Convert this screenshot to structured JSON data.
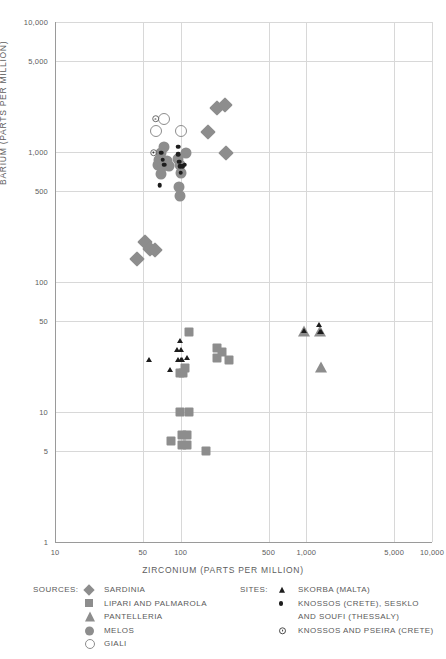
{
  "chart_data": {
    "type": "scatter",
    "title": "",
    "xlabel": "ZIRCONIUM (PARTS PER MILLION)",
    "ylabel": "BARIUM (PARTS PER MILLION)",
    "xscale": "log",
    "yscale": "log",
    "xlim": [
      10,
      10000
    ],
    "ylim": [
      1,
      10000
    ],
    "grid": true,
    "xticks": [
      10,
      50,
      100,
      500,
      1000,
      5000,
      10000
    ],
    "xtick_labels": [
      "10",
      "50",
      "100",
      "500",
      "1,000",
      "5,000",
      "10,000"
    ],
    "yticks": [
      1,
      5,
      10,
      50,
      100,
      500,
      1000,
      5000,
      10000
    ],
    "ytick_labels": [
      "1",
      "5",
      "10",
      "50",
      "100",
      "500",
      "1,000",
      "5,000",
      "10,000"
    ],
    "legend_position": "below",
    "series": [
      {
        "name": "SARDINIA",
        "marker": "diamond",
        "color": "#8d8d8d",
        "group": "sources",
        "points": [
          [
            45,
            150
          ],
          [
            52,
            205
          ],
          [
            57,
            180
          ],
          [
            62,
            175
          ],
          [
            164,
            1430
          ],
          [
            196,
            2180
          ],
          [
            225,
            2300
          ],
          [
            228,
            990
          ]
        ]
      },
      {
        "name": "LIPARI AND PALMAROLA",
        "marker": "square",
        "color": "#8d8d8d",
        "group": "sources",
        "points": [
          [
            99,
            20
          ],
          [
            104,
            20
          ],
          [
            108,
            22
          ],
          [
            117,
            41
          ],
          [
            193,
            31
          ],
          [
            196,
            26
          ],
          [
            213,
            29
          ],
          [
            243,
            25
          ],
          [
            99,
            10
          ],
          [
            116,
            10
          ],
          [
            83,
            6
          ],
          [
            102,
            6.7
          ],
          [
            113,
            6.7
          ],
          [
            102,
            5.6
          ],
          [
            113,
            5.6
          ],
          [
            159,
            5
          ]
        ]
      },
      {
        "name": "PANTELLERIA",
        "marker": "triangle",
        "color": "#8d8d8d",
        "group": "sources",
        "points": [
          [
            960,
            41
          ],
          [
            1290,
            41
          ],
          [
            1310,
            22
          ]
        ]
      },
      {
        "name": "MELOS",
        "marker": "circle",
        "color": "#8d8d8d",
        "group": "sources",
        "points": [
          [
            73,
            1100
          ],
          [
            70,
            990
          ],
          [
            67,
            870
          ],
          [
            72,
            850
          ],
          [
            78,
            850
          ],
          [
            66,
            790
          ],
          [
            72,
            780
          ],
          [
            80,
            780
          ],
          [
            70,
            680
          ],
          [
            95,
            880
          ],
          [
            99,
            800
          ],
          [
            100,
            690
          ],
          [
            97,
            540
          ],
          [
            98,
            460
          ],
          [
            110,
            980
          ]
        ]
      },
      {
        "name": "GIALI",
        "marker": "open-circle",
        "color": "#8d8d8d",
        "group": "sources",
        "points": [
          [
            63,
            1450
          ],
          [
            73,
            1800
          ],
          [
            100,
            1450
          ]
        ]
      },
      {
        "name": "SKORBA (MALTA)",
        "marker": "triangle-small",
        "color": "#1d1d1d",
        "group": "sites",
        "points": [
          [
            56,
            25
          ],
          [
            82,
            21
          ],
          [
            98,
            35
          ],
          [
            94,
            30
          ],
          [
            100,
            30
          ],
          [
            95,
            25
          ],
          [
            100,
            25
          ],
          [
            103,
            25
          ],
          [
            112,
            26
          ],
          [
            955,
            42
          ],
          [
            1270,
            47
          ],
          [
            1285,
            41
          ],
          [
            1300,
            41
          ]
        ]
      },
      {
        "name": "KNOSSOS (CRETE), SESKLO AND SOUFI (THESSALY)",
        "marker": "dot",
        "color": "#1d1d1d",
        "group": "sites",
        "points": [
          [
            70,
            990
          ],
          [
            72,
            870
          ],
          [
            74,
            800
          ],
          [
            68,
            555
          ],
          [
            96,
            1100
          ],
          [
            96,
            960
          ],
          [
            97,
            840
          ],
          [
            99,
            780
          ],
          [
            100,
            690
          ],
          [
            104,
            780
          ],
          [
            108,
            800
          ]
        ]
      },
      {
        "name": "KNOSSOS AND PSEIRA (CRETE)",
        "marker": "open-dot",
        "color": "#4a4a4a",
        "group": "sites",
        "points": [
          [
            63,
            1800
          ],
          [
            61,
            990
          ]
        ]
      }
    ]
  },
  "legend": {
    "sources_header": "SOURCES:",
    "sites_header": "SITES:",
    "sources": [
      {
        "label": "SARDINIA",
        "symbol": "diamond-icon"
      },
      {
        "label": "LIPARI AND PALMAROLA",
        "symbol": "square-icon"
      },
      {
        "label": "PANTELLERIA",
        "symbol": "triangle-icon"
      },
      {
        "label": "MELOS",
        "symbol": "circle-icon"
      },
      {
        "label": "GIALI",
        "symbol": "open-circle-icon"
      }
    ],
    "sites": [
      {
        "label": "SKORBA  (MALTA)",
        "symbol": "triangle-small-icon",
        "line2": ""
      },
      {
        "label": "KNOSSOS (CRETE), SESKLO",
        "symbol": "dot-icon",
        "line2": "AND SOUFI  (THESSALY)"
      },
      {
        "label": "KNOSSOS AND PSEIRA (CRETE)",
        "symbol": "open-dot-icon",
        "line2": ""
      }
    ]
  }
}
